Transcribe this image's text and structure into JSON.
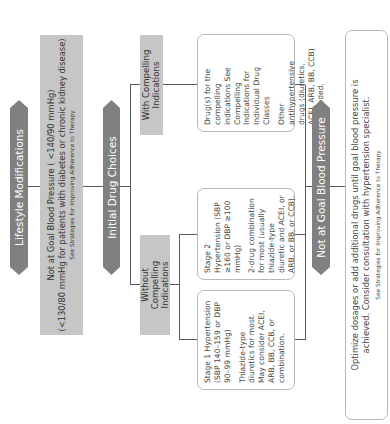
{
  "diagram": {
    "orientation": "rotated -90deg",
    "colors": {
      "arrow": "#808080",
      "gray_box": "#c6c6c6",
      "box_border": "#b8b8b8",
      "line": "#5a5a5a"
    },
    "lifestyle": {
      "label": "Lifestyle Modifications"
    },
    "not_at_goal_1": {
      "line1": "Not at Goal Blood Pressure ( <140/90 mmHg)",
      "line2": "(<130/80 mmHg for patients with diabetes or chronic kidney disease)",
      "link": "See Strategies for Improving Adherence to Therapy"
    },
    "initial": {
      "label": "Initial Drug Choices"
    },
    "without": {
      "label": "Without Compelling Indications"
    },
    "with": {
      "label": "With Compelling Indications"
    },
    "stage1": {
      "title": "Stage 1 Hypertension (SBP 140–159 or DBP 90–99 mmHg)",
      "body": "Thiazide-type diuretics for most. May consider ACEI, ARB, BB, CCB, or combination."
    },
    "stage2": {
      "title": "Stage 2 Hypertension (SBP ≥160 or DBP ≥100 mmHg)",
      "body": "2-drug combination for most (usually thiazide-type diuretic and ACEI, or ARB, or BB, or CCB)."
    },
    "compelling": {
      "title": "Drug(s) for the compelling indications See Compelling Indications for Individual Drug Classes",
      "body": "Other antihypertensive drugs (diuretics, ACEI, ARB, BB, CCB) as needed."
    },
    "not_at_goal_2": {
      "label": "Not at Goal Blood Pressure"
    },
    "optimize": {
      "text": "Optimize dosages or add additional drugs until goal blood pressure is achieved. Consider consultation with hypertension specialist.",
      "link": "See Strategies for Improving Adherence to Therapy"
    }
  }
}
